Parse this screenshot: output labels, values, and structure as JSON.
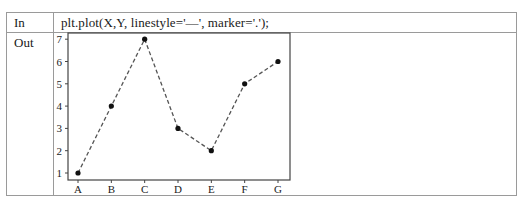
{
  "cells": {
    "in_label": "In",
    "out_label": "Out",
    "code": "plt.plot(X,Y, linestyle='—', marker='.');"
  },
  "chart_data": {
    "type": "line",
    "title": "",
    "xlabel": "",
    "ylabel": "",
    "categories": [
      "A",
      "B",
      "C",
      "D",
      "E",
      "F",
      "G"
    ],
    "values": [
      1,
      4,
      7,
      3,
      2,
      5,
      6
    ],
    "series": [
      {
        "name": "Y",
        "values": [
          1,
          4,
          7,
          3,
          2,
          5,
          6
        ],
        "linestyle": "dashed",
        "marker": "dot",
        "color": "#555555"
      }
    ],
    "yticks": [
      1,
      2,
      3,
      4,
      5,
      6,
      7
    ],
    "ylim": [
      0.7,
      7.3
    ],
    "grid": false,
    "legend": false
  }
}
